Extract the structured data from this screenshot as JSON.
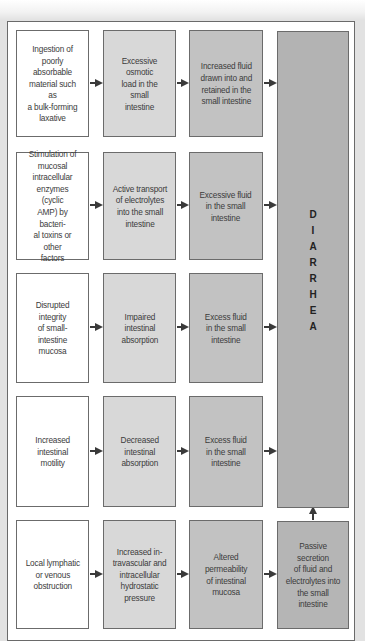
{
  "diagram": {
    "outcome": {
      "label": "DIARRHEA",
      "letters": [
        "D",
        "I",
        "A",
        "R",
        "R",
        "H",
        "E",
        "A"
      ]
    },
    "rows": [
      {
        "cause": "Ingestion of poorly absorbable material such as a bulk-forming laxative",
        "step2": "Excessive osmotic load in the small intestine",
        "step3": "Increased fluid drawn into and retained in the small intestine"
      },
      {
        "cause": "Stimulation of mucosal intracellular enzymes (cyclic AMP) by bacterial toxins or other factors",
        "step2": "Active transport of electrolytes into the small intestine",
        "step3": "Excessive fluid in the small intestine"
      },
      {
        "cause": "Disrupted integrity of small-intestine mucosa",
        "step2": "Impaired intestinal absorption",
        "step3": "Excess fluid in the small intestine"
      },
      {
        "cause": "Increased intestinal motility",
        "step2": "Decreased intestinal absorption",
        "step3": "Excess fluid in the small intestine"
      },
      {
        "cause": "Local lymphatic or venous obstruction",
        "step2": "Increased intravascular and intracellular hydrostatic pressure",
        "step3": "Altered permeability of intestinal mucosa",
        "step4": "Passive secretion of fluid and electrolytes into the small intestine"
      }
    ],
    "display_text": {
      "r1c1": [
        "Ingestion of",
        "poorly",
        "absorbable",
        "material such as",
        "a bulk-forming",
        "laxative"
      ],
      "r1c2": [
        "Excessive osmotic",
        "load in the small",
        "intestine"
      ],
      "r1c3": [
        "Increased fluid",
        "drawn into and",
        "retained in the",
        "small intestine"
      ],
      "r2c1": [
        "Stimulation of",
        "mucosal",
        "intracellular",
        "enzymes (cyclic",
        "AMP) by bacteri-",
        "al toxins or other",
        "factors"
      ],
      "r2c2": [
        "Active transport",
        "of electrolytes",
        "into the small",
        "intestine"
      ],
      "r2c3": [
        "Excessive fluid",
        "in the small",
        "intestine"
      ],
      "r3c1": [
        "Disrupted integrity",
        "of small-intestine",
        "mucosa"
      ],
      "r3c2": [
        "Impaired",
        "intestinal",
        "absorption"
      ],
      "r3c3": [
        "Excess fluid",
        "in the small",
        "intestine"
      ],
      "r4c1": [
        "Increased",
        "intestinal",
        "motility"
      ],
      "r4c2": [
        "Decreased",
        "intestinal",
        "absorption"
      ],
      "r4c3": [
        "Excess fluid",
        "in the small",
        "intestine"
      ],
      "r5c1": [
        "Local lymphatic",
        "or venous",
        "obstruction"
      ],
      "r5c2": [
        "Increased in-",
        "travascular and",
        "intracellular",
        "hydrostatic",
        "pressure"
      ],
      "r5c3": [
        "Altered",
        "permeability",
        "of intestinal",
        "mucosa"
      ],
      "r5c4": [
        "Passive secretion",
        "of fluid and",
        "electrolytes into",
        "the small",
        "intestine"
      ]
    },
    "colors": {
      "column1": "#ffffff",
      "column2": "#d8d8d8",
      "column3": "#c2c2c2",
      "outcome": "#b3b3b3",
      "border": "#6b6b6b",
      "arrow": "#3a3a3a"
    }
  }
}
